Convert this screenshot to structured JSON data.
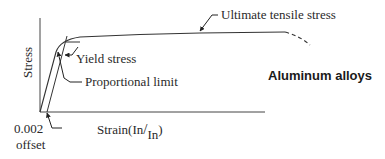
{
  "diagram": {
    "title": "Aluminum alloys",
    "axes": {
      "y_label": "Stress",
      "x_label_prefix": "Strain(",
      "x_label_num": "In",
      "x_label_slash": "/",
      "x_label_den": "In",
      "x_label_suffix": ")"
    },
    "annotations": {
      "ultimate": "Ultimate tensile stress",
      "yield": "Yield stress",
      "proportional": "Proportional limit",
      "offset_value": "0.002",
      "offset_word": "offset"
    },
    "colors": {
      "line": "#333333",
      "text": "#2a2a2a",
      "background": "#ffffff"
    }
  }
}
